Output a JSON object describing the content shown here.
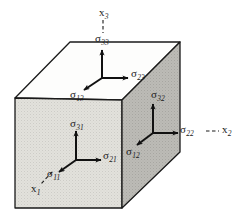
{
  "figure": {
    "type": "diagram",
    "background_color": "#ffffff",
    "line_color": "#1a1a1a",
    "faces": {
      "top": {
        "name": "top-face",
        "fill": "#ffffff",
        "stipple": false
      },
      "front": {
        "name": "front-face",
        "fill": "#dddcd7",
        "stipple": true
      },
      "side": {
        "name": "right-side-face",
        "fill": "#b9b8b3",
        "stipple": true
      }
    },
    "axes": [
      {
        "id": "x1",
        "symbol": "x",
        "subscript": "1",
        "label": "x₁",
        "x": 31,
        "y": 186,
        "leader": "dashed"
      },
      {
        "id": "x2",
        "symbol": "x",
        "subscript": "2",
        "label": "x₂",
        "x": 222,
        "y": 128,
        "leader": "dashed"
      },
      {
        "id": "x3",
        "symbol": "x",
        "subscript": "3",
        "label": "x₃",
        "x": 99,
        "y": 7,
        "leader": "dashed"
      }
    ],
    "stress_labels": [
      {
        "id": "sigma33",
        "symbol": "σ",
        "subscript": "33",
        "label": "σ₃₃",
        "face": "top",
        "direction": "up",
        "x": 96,
        "y": 36
      },
      {
        "id": "sigma23",
        "symbol": "σ",
        "subscript": "23",
        "label": "σ₂₃",
        "face": "top",
        "direction": "right",
        "x": 131,
        "y": 69
      },
      {
        "id": "sigma13",
        "symbol": "σ",
        "subscript": "13",
        "label": "σ₁₃",
        "face": "top",
        "direction": "down-left",
        "x": 72,
        "y": 90
      },
      {
        "id": "sigma31",
        "symbol": "σ",
        "subscript": "31",
        "label": "σ₃₁",
        "face": "front",
        "direction": "up",
        "x": 70,
        "y": 120
      },
      {
        "id": "sigma21",
        "symbol": "σ",
        "subscript": "21",
        "label": "σ₂₁",
        "face": "front",
        "direction": "right",
        "x": 102,
        "y": 151
      },
      {
        "id": "sigma11",
        "symbol": "σ",
        "subscript": "11",
        "label": "σ₁₁",
        "face": "front",
        "direction": "down-left",
        "x": 48,
        "y": 168
      },
      {
        "id": "sigma32",
        "symbol": "σ",
        "subscript": "32",
        "label": "σ₃₂",
        "face": "side",
        "direction": "up",
        "x": 152,
        "y": 91
      },
      {
        "id": "sigma22",
        "symbol": "σ",
        "subscript": "22",
        "label": "σ₂₂",
        "face": "side",
        "direction": "right",
        "x": 180,
        "y": 126
      },
      {
        "id": "sigma12",
        "symbol": "σ",
        "subscript": "12",
        "label": "σ₁₂",
        "face": "side",
        "direction": "down-left",
        "x": 128,
        "y": 148
      }
    ]
  }
}
